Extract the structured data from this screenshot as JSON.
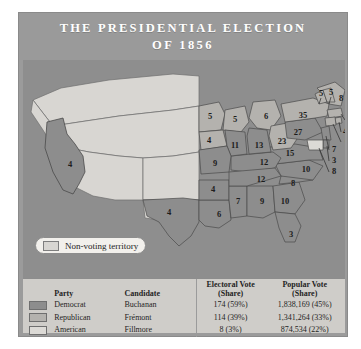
{
  "title": {
    "line1": "THE PRESIDENTIAL ELECTION",
    "line2": "OF 1856"
  },
  "map": {
    "nonvoting_legend": "Non-voting territory",
    "states": [
      {
        "name": "california",
        "value": "4",
        "x": 47,
        "y": 105,
        "party": "democrat"
      },
      {
        "name": "texas",
        "value": "4",
        "x": 146,
        "y": 153,
        "party": "democrat"
      },
      {
        "name": "minnesota",
        "value": "5",
        "x": 187,
        "y": 57,
        "party": "republican"
      },
      {
        "name": "wisconsin",
        "value": "5",
        "x": 212,
        "y": 60,
        "party": "republican"
      },
      {
        "name": "michigan",
        "value": "6",
        "x": 243,
        "y": 57,
        "party": "republican"
      },
      {
        "name": "iowa",
        "value": "4",
        "x": 186,
        "y": 81,
        "party": "republican"
      },
      {
        "name": "illinois",
        "value": "11",
        "x": 212,
        "y": 86,
        "party": "democrat"
      },
      {
        "name": "indiana",
        "value": "13",
        "x": 236,
        "y": 86,
        "party": "democrat"
      },
      {
        "name": "ohio",
        "value": "23",
        "x": 259,
        "y": 82,
        "party": "republican"
      },
      {
        "name": "missouri",
        "value": "9",
        "x": 192,
        "y": 104,
        "party": "democrat"
      },
      {
        "name": "kentucky",
        "value": "12",
        "x": 241,
        "y": 103,
        "party": "democrat"
      },
      {
        "name": "tennessee",
        "value": "12",
        "x": 238,
        "y": 120,
        "party": "democrat"
      },
      {
        "name": "arkansas",
        "value": "4",
        "x": 190,
        "y": 130,
        "party": "democrat"
      },
      {
        "name": "mississippi",
        "value": "7",
        "x": 215,
        "y": 142,
        "party": "democrat"
      },
      {
        "name": "alabama",
        "value": "9",
        "x": 239,
        "y": 142,
        "party": "democrat"
      },
      {
        "name": "louisiana",
        "value": "6",
        "x": 196,
        "y": 155,
        "party": "democrat"
      },
      {
        "name": "georgia",
        "value": "10",
        "x": 262,
        "y": 142,
        "party": "democrat"
      },
      {
        "name": "florida",
        "value": "3",
        "x": 268,
        "y": 175,
        "party": "democrat"
      },
      {
        "name": "south-carolina",
        "value": "8",
        "x": 270,
        "y": 124,
        "party": "democrat"
      },
      {
        "name": "north-carolina",
        "value": "10",
        "x": 283,
        "y": 110,
        "party": "democrat"
      },
      {
        "name": "virginia",
        "value": "15",
        "x": 267,
        "y": 94,
        "party": "democrat"
      },
      {
        "name": "pennsylvania",
        "value": "27",
        "x": 275,
        "y": 73,
        "party": "democrat"
      },
      {
        "name": "new-york",
        "value": "35",
        "x": 280,
        "y": 56,
        "party": "republican"
      },
      {
        "name": "maine",
        "value": "8",
        "x": 318,
        "y": 39,
        "party": "republican"
      },
      {
        "name": "vermont",
        "value": "5",
        "x": 298,
        "y": 34,
        "party": "republican"
      },
      {
        "name": "new-hampshire",
        "value": "5",
        "x": 308,
        "y": 33,
        "party": "republican"
      },
      {
        "name": "massachusetts",
        "value": "13",
        "x": 326,
        "y": 59,
        "party": "republican"
      },
      {
        "name": "rhode-island",
        "value": "4",
        "x": 322,
        "y": 72,
        "party": "republican"
      },
      {
        "name": "connecticut",
        "value": "6",
        "x": 324,
        "y": 82,
        "party": "republican"
      },
      {
        "name": "new-jersey",
        "value": "7",
        "x": 311,
        "y": 90,
        "party": "democrat"
      },
      {
        "name": "delaware",
        "value": "3",
        "x": 311,
        "y": 101,
        "party": "democrat"
      },
      {
        "name": "maryland",
        "value": "8",
        "x": 311,
        "y": 112,
        "party": "american"
      }
    ]
  },
  "legend": {
    "headers": {
      "party": "Party",
      "candidate": "Candidate",
      "electoral_line1": "Electoral Vote",
      "electoral_line2": "(Share)",
      "popular_line1": "Popular Vote",
      "popular_line2": "(Share)"
    },
    "rows": [
      {
        "party": "Democrat",
        "candidate": "Buchanan",
        "electoral": "174 (59%)",
        "popular": "1,838,169 (45%)",
        "swatch": "dem"
      },
      {
        "party": "Republican",
        "candidate": "Frémont",
        "electoral": "114 (39%)",
        "popular": "1,341,264 (33%)",
        "swatch": "rep"
      },
      {
        "party": "American",
        "candidate": "Fillmore",
        "electoral": "8 (3%)",
        "popular": "874,534 (22%)",
        "swatch": "ame"
      }
    ]
  },
  "colors": {
    "panel_bg": "#9b9b9b",
    "map_bg": "#8e8e8e",
    "legend_bg": "#cfcdc9",
    "democrat": "#8d8d8d",
    "republican": "#b4b2ae",
    "american": "#dcdad6",
    "nonvoting": "#d8d6d2",
    "title_text": "#ffffff"
  }
}
